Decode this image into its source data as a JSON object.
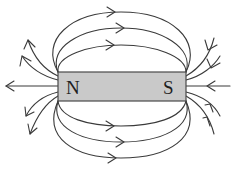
{
  "diagram": {
    "magnet": {
      "north_label": "N",
      "south_label": "S",
      "fill_color": "#c9c9c9",
      "outline_color": "#4a4a4a"
    },
    "field_lines": {
      "color": "#3a3a3a",
      "top_loops": 3,
      "bottom_loops": 3,
      "north_radial_lines": 5,
      "south_radial_lines": 5,
      "direction": "out of N, into S"
    }
  }
}
